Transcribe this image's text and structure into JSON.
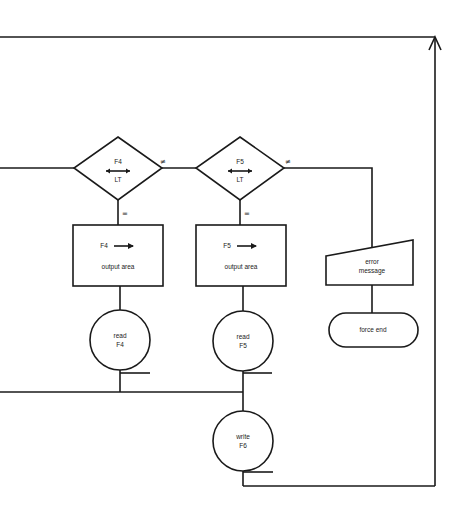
{
  "diagram": {
    "type": "flowchart",
    "decisions": [
      {
        "id": "d1",
        "top": "F4",
        "bottom": "LT",
        "arrow": "left-right",
        "ne_label": "≠",
        "eq_label": "="
      },
      {
        "id": "d2",
        "top": "F5",
        "bottom": "LT",
        "arrow": "left-right",
        "ne_label": "≠",
        "eq_label": "="
      }
    ],
    "processes": [
      {
        "id": "p1",
        "line1": "F4",
        "line2": "output area"
      },
      {
        "id": "p2",
        "line1": "F5",
        "line2": "output area"
      }
    ],
    "manual_input": {
      "id": "err",
      "line1": "error",
      "line2": "message"
    },
    "terminator": {
      "id": "end",
      "label": "force end"
    },
    "io_circles": [
      {
        "id": "c1",
        "line1": "read",
        "line2": "F4"
      },
      {
        "id": "c2",
        "line1": "read",
        "line2": "F5"
      },
      {
        "id": "c3",
        "line1": "write",
        "line2": "F6"
      }
    ],
    "colors": {
      "stroke": "#1a1a1a",
      "background": "#ffffff"
    }
  }
}
